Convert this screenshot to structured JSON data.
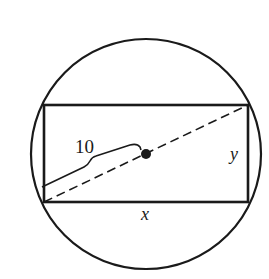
{
  "diagram": {
    "colors": {
      "stroke": "#1a1a1a",
      "background": "#ffffff"
    },
    "circle": {
      "cx": 146,
      "cy": 154,
      "r": 115
    },
    "rectangle": {
      "x": 44,
      "y": 105,
      "width": 204,
      "height": 97
    },
    "center_point": {
      "cx": 146,
      "cy": 154,
      "r": 5
    },
    "labels": {
      "radius": "10",
      "height": "y",
      "width": "x"
    }
  }
}
